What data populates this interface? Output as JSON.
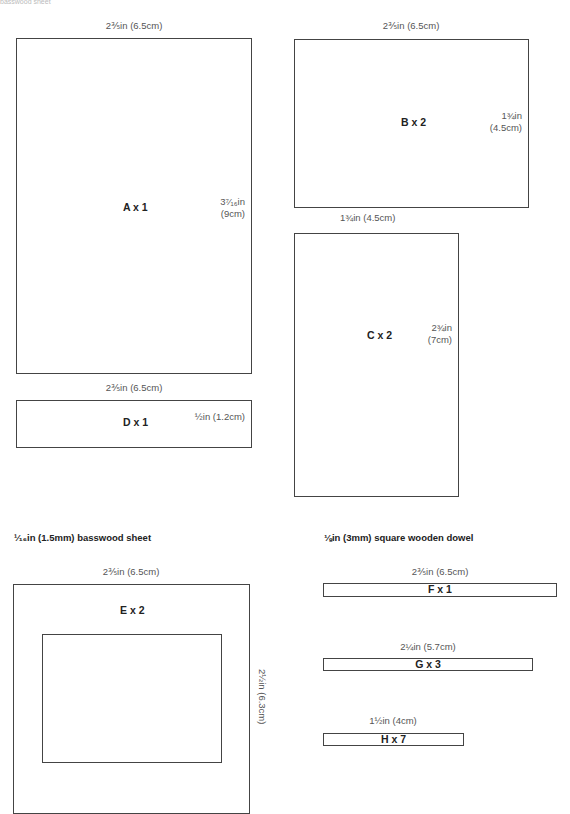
{
  "top_fragment": "basswood sheet",
  "sections": {
    "basswood_header": "¹⁄₁₆in (1.5mm) basswood sheet",
    "dowel_header": "⅛in (3mm) square wooden dowel"
  },
  "pieces": {
    "A": {
      "label": "A x 1",
      "width": "2⅗in (6.5cm)",
      "height_in": "3⁷⁄₁₆in",
      "height_cm": "(9cm)"
    },
    "B": {
      "label": "B x 2",
      "width": "2⅗in (6.5cm)",
      "height_in": "1¾in",
      "height_cm": "(4.5cm)"
    },
    "C": {
      "label": "C x 2",
      "width": "1¾in (4.5cm)",
      "height_in": "2¾in",
      "height_cm": "(7cm)"
    },
    "D": {
      "label": "D x 1",
      "width": "2⅗in (6.5cm)",
      "height": "½in (1.2cm)"
    },
    "E": {
      "label": "E x 2",
      "width": "2⅗in (6.5cm)",
      "height": "2½in (6.3cm)"
    },
    "F": {
      "label": "F x 1",
      "length": "2⅗in (6.5cm)"
    },
    "G": {
      "label": "G x 3",
      "length": "2¼in (5.7cm)"
    },
    "H": {
      "label": "H x 7",
      "length": "1½in (4cm)"
    }
  },
  "colors": {
    "outline": "#444444",
    "label_text": "#222222",
    "dimension_text": "#555555"
  }
}
